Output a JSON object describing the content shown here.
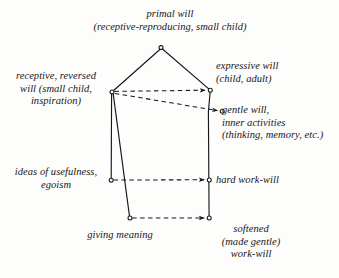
{
  "figure": {
    "type": "diagram",
    "style": "hand-drawn pentagon schematic, italic serif labels, black ink on off-white paper",
    "background_color": "#fdfdfc",
    "ink_color": "#17161a"
  },
  "labels": {
    "primal_will": "primal will\n(receptive-reproducing, small child)",
    "receptive_reversed_will": "receptive, reversed\nwill (small child,\ninspiration)",
    "expressive_will": "expressive will\n(child, adult)",
    "gentle_will": "gentle will,\ninner activities\n(thinking, memory, etc.)",
    "ideas_of_usefulness": "ideas of usefulness,\negoism",
    "hard_work_will": "hard work-will",
    "giving_meaning": "giving meaning",
    "softened_work_will": "softened\n(made gentle)\nwork-will"
  },
  "nodes": [
    {
      "id": "apex",
      "label_ref": "primal_will",
      "x": 161,
      "y": 48,
      "marker": "open-circle"
    },
    {
      "id": "left-upper",
      "label_ref": "receptive_reversed_will",
      "x": 112,
      "y": 92,
      "marker": "open-circle"
    },
    {
      "id": "right-upper",
      "label_ref": "expressive_will",
      "x": 210,
      "y": 90,
      "marker": "open-circle"
    },
    {
      "id": "gentle",
      "label_ref": "gentle_will",
      "x": 222,
      "y": 111,
      "marker": "open-circle"
    },
    {
      "id": "left-middle",
      "label_ref": "ideas_of_usefulness",
      "x": 111,
      "y": 180,
      "marker": "open-circle"
    },
    {
      "id": "right-middle",
      "label_ref": "hard_work_will",
      "x": 209,
      "y": 180,
      "marker": "open-circle"
    },
    {
      "id": "bottom-left",
      "label_ref": "giving_meaning",
      "x": 130,
      "y": 218,
      "marker": "open-circle"
    },
    {
      "id": "bottom-right",
      "label_ref": "softened_work_will",
      "x": 209,
      "y": 218,
      "marker": "open-circle"
    }
  ],
  "edges": [
    {
      "id": "apex-to-left-upper",
      "from": "apex",
      "to": "left-upper",
      "style": "solid"
    },
    {
      "id": "apex-to-right-upper",
      "from": "apex",
      "to": "right-upper",
      "style": "solid"
    },
    {
      "id": "left-upper-to-left-middle",
      "from": "left-upper",
      "to": "left-middle",
      "style": "solid"
    },
    {
      "id": "left-upper-to-bottom-left",
      "from": "left-upper",
      "to": "bottom-left",
      "style": "solid"
    },
    {
      "id": "right-upper-to-bottom-right",
      "from": "right-upper",
      "to": "bottom-right",
      "style": "solid"
    },
    {
      "id": "arrow-upper",
      "from": "left-upper",
      "to": "right-upper",
      "style": "dashed",
      "arrow": true
    },
    {
      "id": "arrow-gentle",
      "from": "left-upper",
      "to": "gentle",
      "style": "dashed",
      "arrow": true
    },
    {
      "id": "arrow-middle",
      "from": "left-middle",
      "to": "right-middle",
      "style": "dashed",
      "arrow": true
    },
    {
      "id": "arrow-bottom",
      "from": "bottom-left",
      "to": "bottom-right",
      "style": "dashed",
      "arrow": true
    }
  ]
}
